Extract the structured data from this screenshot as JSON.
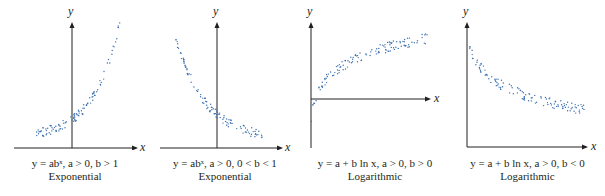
{
  "figure": {
    "panels": [
      {
        "id": "exp-growth",
        "equation": "y = abˣ, a > 0, b > 1",
        "type_label": "Exponential",
        "x_axis_label": "x",
        "y_axis_label": "y"
      },
      {
        "id": "exp-decay",
        "equation": "y = abˣ, a > 0, 0 < b < 1",
        "type_label": "Exponential",
        "x_axis_label": "x",
        "y_axis_label": "y"
      },
      {
        "id": "log-increasing",
        "equation": "y = a + b ln x, a > 0, b > 0",
        "type_label": "Logarithmic",
        "x_axis_label": "x",
        "y_axis_label": "y"
      },
      {
        "id": "log-decreasing",
        "equation": "y = a + b ln x, a > 0, b < 0",
        "type_label": "Logarithmic",
        "x_axis_label": "x",
        "y_axis_label": "y"
      }
    ],
    "colors": {
      "axis": "#231f20",
      "dots": "#3a6fb0",
      "text": "#231f20"
    }
  }
}
